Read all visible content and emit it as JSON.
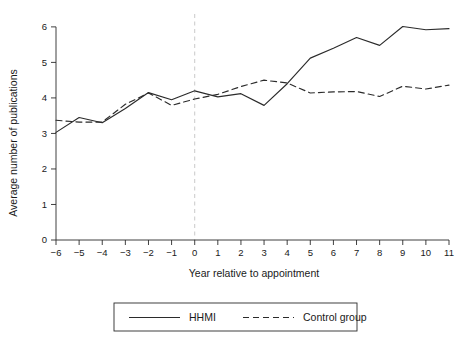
{
  "chart_data": {
    "type": "line",
    "title": "",
    "subtitle": "",
    "xlabel": "Year relative to appointment",
    "ylabel": "Average number of publications",
    "x": [
      -6,
      -5,
      -4,
      -3,
      -2,
      -1,
      0,
      1,
      2,
      3,
      4,
      5,
      6,
      7,
      8,
      9,
      10,
      11
    ],
    "xticklabels": [
      "-6",
      "-5",
      "-4",
      "-3",
      "-2",
      "-1",
      "0",
      "1",
      "2",
      "3",
      "4",
      "5",
      "6",
      "7",
      "8",
      "9",
      "10",
      "11"
    ],
    "yticklabels": [
      "0",
      "1",
      "2",
      "3",
      "4",
      "5",
      "6"
    ],
    "yticks": [
      0,
      1,
      2,
      3,
      4,
      5,
      6
    ],
    "xlim": [
      -6,
      11
    ],
    "ylim": [
      0,
      6.25
    ],
    "grid": false,
    "legend_position": "below-plot",
    "reference_line": {
      "axis": "x",
      "value": 0,
      "style": "dashed",
      "color": "#c9c9c9"
    },
    "series": [
      {
        "name": "HHMI",
        "style": "solid",
        "color": "#2b2b2b",
        "values": [
          3.03,
          3.45,
          3.3,
          3.7,
          4.15,
          3.95,
          4.2,
          4.03,
          4.12,
          3.79,
          4.4,
          5.12,
          5.4,
          5.7,
          5.48,
          6.01,
          5.92,
          5.95
        ]
      },
      {
        "name": "Control group",
        "style": "dashed",
        "color": "#2b2b2b",
        "values": [
          3.37,
          3.32,
          3.32,
          3.82,
          4.14,
          3.79,
          3.97,
          4.1,
          4.32,
          4.5,
          4.42,
          4.14,
          4.17,
          4.18,
          4.04,
          4.33,
          4.25,
          4.36
        ]
      }
    ]
  },
  "legend": {
    "entries": [
      {
        "label": "HHMI",
        "style": "solid"
      },
      {
        "label": "Control group",
        "style": "dashed"
      }
    ]
  }
}
